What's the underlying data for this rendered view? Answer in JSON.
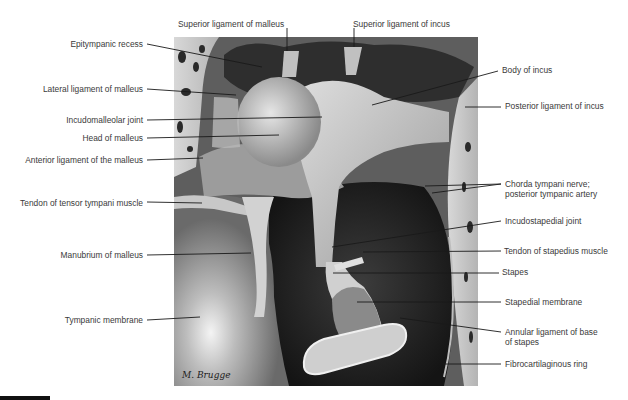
{
  "figure": {
    "signature": "M. Brugge",
    "labels_left": [
      {
        "id": "epitympanic-recess",
        "text": "Epitympanic recess",
        "x": 143,
        "y": 41
      },
      {
        "id": "lateral-ligament-of-malleus",
        "text": "Lateral ligament of malleus",
        "x": 143,
        "y": 86
      },
      {
        "id": "incudomalleolar-joint",
        "text": "Incudomalleolar joint",
        "x": 143,
        "y": 117
      },
      {
        "id": "head-of-malleus",
        "text": "Head of malleus",
        "x": 143,
        "y": 135
      },
      {
        "id": "anterior-ligament-of-the-malleus",
        "text": "Anterior ligament of the malleus",
        "x": 143,
        "y": 157
      },
      {
        "id": "tendon-of-tensor-tympani-muscle",
        "text": "Tendon of tensor tympani muscle",
        "x": 143,
        "y": 200
      },
      {
        "id": "manubrium-of-malleus",
        "text": "Manubrium of malleus",
        "x": 143,
        "y": 252
      },
      {
        "id": "tympanic-membrane",
        "text": "Tympanic membrane",
        "x": 143,
        "y": 317
      }
    ],
    "labels_top": [
      {
        "id": "superior-ligament-of-malleus",
        "text": "Superior ligament of malleus",
        "x": 178,
        "y": 21
      },
      {
        "id": "superior-ligament-of-incus",
        "text": "Superior ligament of incus",
        "x": 353,
        "y": 21
      }
    ],
    "labels_right": [
      {
        "id": "body-of-incus",
        "text": "Body of incus",
        "x": 502,
        "y": 67
      },
      {
        "id": "posterior-ligament-of-incus",
        "text": "Posterior ligament of incus",
        "x": 505,
        "y": 103
      },
      {
        "id": "chorda-tympani-nerve",
        "text": "Chorda tympani nerve;",
        "x": 505,
        "y": 181
      },
      {
        "id": "posterior-tympanic-artery",
        "text": "posterior tympanic artery",
        "x": 505,
        "y": 191
      },
      {
        "id": "incudostapedial-joint",
        "text": "Incudostapedial joint",
        "x": 505,
        "y": 218
      },
      {
        "id": "tendon-of-stapedius-muscle",
        "text": "Tendon of stapedius muscle",
        "x": 504,
        "y": 248
      },
      {
        "id": "stapes",
        "text": "Stapes",
        "x": 502,
        "y": 269
      },
      {
        "id": "stapedial-membrane",
        "text": "Stapedial membrane",
        "x": 505,
        "y": 299
      },
      {
        "id": "annular-ligament-of-base",
        "text": "Annular ligament of base",
        "x": 505,
        "y": 329
      },
      {
        "id": "of-stapes",
        "text": "of stapes",
        "x": 505,
        "y": 339
      },
      {
        "id": "fibrocartilaginous-ring",
        "text": "Fibrocartilaginous ring",
        "x": 505,
        "y": 361
      }
    ],
    "leader_lines": [
      [
        147,
        44,
        262,
        67
      ],
      [
        147,
        89,
        236,
        95
      ],
      [
        147,
        120,
        322,
        117
      ],
      [
        147,
        138,
        279,
        135
      ],
      [
        147,
        160,
        203,
        158
      ],
      [
        147,
        202,
        202,
        203
      ],
      [
        147,
        255,
        251,
        253
      ],
      [
        147,
        320,
        200,
        317
      ],
      [
        287,
        28,
        287,
        51
      ],
      [
        354,
        28,
        354,
        47
      ],
      [
        498,
        71,
        372,
        105
      ],
      [
        501,
        107,
        465,
        107
      ],
      [
        501,
        184,
        425,
        186
      ],
      [
        501,
        184,
        432,
        193
      ],
      [
        501,
        221,
        332,
        247
      ],
      [
        501,
        251,
        363,
        252
      ],
      [
        499,
        273,
        333,
        273
      ],
      [
        501,
        302,
        357,
        302
      ],
      [
        501,
        332,
        400,
        318
      ],
      [
        501,
        364,
        443,
        364
      ]
    ],
    "colors": {
      "text": "#3a3a3a",
      "leader": "#1a1a1a",
      "bone": "#cfcfcf",
      "cavity_dark": "#1e1e1e"
    }
  }
}
